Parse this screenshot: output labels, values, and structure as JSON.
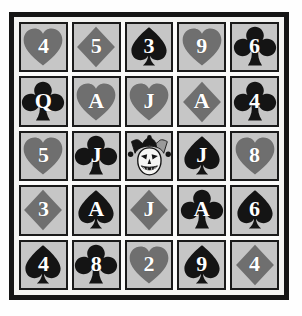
{
  "artwork": {
    "title": "Playing Card Grid",
    "rows": 5,
    "columns": 5,
    "frame_color": "#151515",
    "mat_color": "#fbfbfa",
    "cell_background": "#c6c6c6",
    "black_suit_color": "#141414",
    "red_suit_color": "#6f6f6f",
    "rank_color": "#ffffff"
  },
  "cards": [
    [
      {
        "rank": "4",
        "suit": "hearts",
        "suit_symbol": "♥",
        "color": "red",
        "label": "4 of Hearts"
      },
      {
        "rank": "5",
        "suit": "diamonds",
        "suit_symbol": "♦",
        "color": "red",
        "label": "5 of Diamonds"
      },
      {
        "rank": "3",
        "suit": "spades",
        "suit_symbol": "♠",
        "color": "black",
        "label": "3 of Spades"
      },
      {
        "rank": "9",
        "suit": "hearts",
        "suit_symbol": "♥",
        "color": "red",
        "label": "9 of Hearts"
      },
      {
        "rank": "6",
        "suit": "clubs",
        "suit_symbol": "♣",
        "color": "black",
        "label": "6 of Clubs"
      }
    ],
    [
      {
        "rank": "Q",
        "suit": "clubs",
        "suit_symbol": "♣",
        "color": "black",
        "label": "Queen of Clubs"
      },
      {
        "rank": "A",
        "suit": "hearts",
        "suit_symbol": "♥",
        "color": "red",
        "label": "Ace of Hearts"
      },
      {
        "rank": "J",
        "suit": "hearts",
        "suit_symbol": "♥",
        "color": "red",
        "label": "Jack of Hearts"
      },
      {
        "rank": "A",
        "suit": "diamonds",
        "suit_symbol": "♦",
        "color": "red",
        "label": "Ace of Diamonds"
      },
      {
        "rank": "4",
        "suit": "clubs",
        "suit_symbol": "♣",
        "color": "black",
        "label": "4 of Clubs"
      }
    ],
    [
      {
        "rank": "5",
        "suit": "hearts",
        "suit_symbol": "♥",
        "color": "red",
        "label": "5 of Hearts"
      },
      {
        "rank": "J",
        "suit": "clubs",
        "suit_symbol": "♣",
        "color": "black",
        "label": "Jack of Clubs"
      },
      {
        "rank": "",
        "suit": "joker",
        "suit_symbol": "",
        "color": "black",
        "label": "Joker"
      },
      {
        "rank": "J",
        "suit": "spades",
        "suit_symbol": "♠",
        "color": "black",
        "label": "Jack of Spades"
      },
      {
        "rank": "8",
        "suit": "hearts",
        "suit_symbol": "♥",
        "color": "red",
        "label": "8 of Hearts"
      }
    ],
    [
      {
        "rank": "3",
        "suit": "diamonds",
        "suit_symbol": "♦",
        "color": "red",
        "label": "3 of Diamonds"
      },
      {
        "rank": "A",
        "suit": "spades",
        "suit_symbol": "♠",
        "color": "black",
        "label": "Ace of Spades"
      },
      {
        "rank": "J",
        "suit": "diamonds",
        "suit_symbol": "♦",
        "color": "red",
        "label": "Jack of Diamonds"
      },
      {
        "rank": "A",
        "suit": "clubs",
        "suit_symbol": "♣",
        "color": "black",
        "label": "Ace of Clubs"
      },
      {
        "rank": "6",
        "suit": "spades",
        "suit_symbol": "♠",
        "color": "black",
        "label": "6 of Spades"
      }
    ],
    [
      {
        "rank": "4",
        "suit": "spades",
        "suit_symbol": "♠",
        "color": "black",
        "label": "4 of Spades"
      },
      {
        "rank": "8",
        "suit": "clubs",
        "suit_symbol": "♣",
        "color": "black",
        "label": "8 of Clubs"
      },
      {
        "rank": "2",
        "suit": "hearts",
        "suit_symbol": "♥",
        "color": "red",
        "label": "2 of Hearts"
      },
      {
        "rank": "9",
        "suit": "spades",
        "suit_symbol": "♠",
        "color": "black",
        "label": "9 of Spades"
      },
      {
        "rank": "4",
        "suit": "diamonds",
        "suit_symbol": "♦",
        "color": "red",
        "label": "4 of Diamonds"
      }
    ]
  ]
}
